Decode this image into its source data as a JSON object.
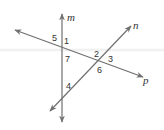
{
  "diagram": {
    "line_color": "#707070",
    "lines": [
      {
        "name": "m",
        "label": "m"
      },
      {
        "name": "n",
        "label": "n"
      },
      {
        "name": "p",
        "label": "p"
      }
    ],
    "angles": [
      {
        "label": "5"
      },
      {
        "label": "1"
      },
      {
        "label": "7"
      },
      {
        "label": "2"
      },
      {
        "label": "3"
      },
      {
        "label": "6"
      },
      {
        "label": "4"
      }
    ]
  }
}
